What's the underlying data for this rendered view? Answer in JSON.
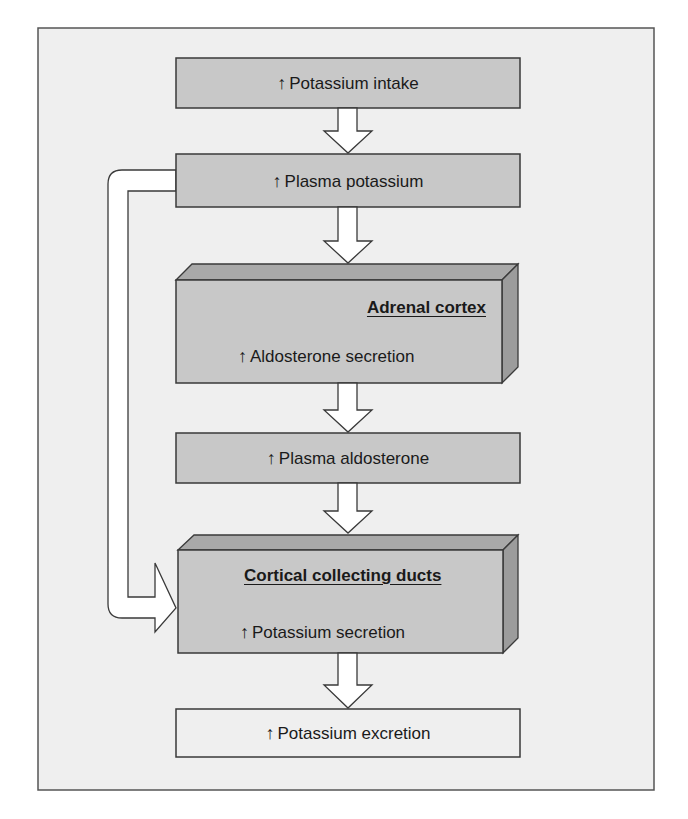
{
  "diagram": {
    "type": "flowchart",
    "up_symbol": "↑",
    "colors": {
      "frame_bg": "#efefef",
      "frame_border": "#555555",
      "box_fill": "#c8c8c8",
      "box_top_face": "#a9a9a9",
      "box_side_face": "#9c9c9c",
      "box_border": "#3a3a3a",
      "arrow_fill": "#ffffff",
      "text": "#1a1a1a"
    },
    "nodes": [
      {
        "id": "intake",
        "label": "Potassium intake",
        "style": "flat-gray"
      },
      {
        "id": "plasma_k",
        "label": "Plasma potassium",
        "style": "flat-gray"
      },
      {
        "id": "adrenal",
        "title": "Adrenal cortex",
        "label": "Aldosterone secretion",
        "style": "3d-gray"
      },
      {
        "id": "plasma_aldo",
        "label": "Plasma aldosterone",
        "style": "flat-gray"
      },
      {
        "id": "ccd",
        "title": "Cortical collecting ducts",
        "label": "Potassium secretion",
        "style": "3d-gray"
      },
      {
        "id": "excretion",
        "label": "Potassium excretion",
        "style": "flat-light"
      }
    ],
    "edges": [
      {
        "from": "intake",
        "to": "plasma_k"
      },
      {
        "from": "plasma_k",
        "to": "adrenal"
      },
      {
        "from": "adrenal",
        "to": "plasma_aldo"
      },
      {
        "from": "plasma_aldo",
        "to": "ccd"
      },
      {
        "from": "plasma_k",
        "to": "ccd",
        "route": "left-bypass"
      },
      {
        "from": "ccd",
        "to": "excretion"
      }
    ]
  }
}
